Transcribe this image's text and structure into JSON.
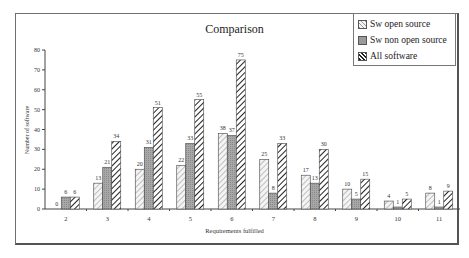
{
  "chart_data": {
    "type": "bar",
    "title": "Comparison",
    "xlabel": "Requirements fulfilled",
    "ylabel": "Number of software",
    "ylim": [
      0,
      80
    ],
    "yticks": [
      0,
      10,
      20,
      30,
      40,
      50,
      60,
      70,
      80
    ],
    "grid": false,
    "legend_position": "top-right",
    "categories": [
      "2",
      "3",
      "4",
      "5",
      "6",
      "7",
      "8",
      "9",
      "10",
      "11"
    ],
    "series": [
      {
        "name": "Sw open source",
        "pattern": "light-diagonal-hatch",
        "values": [
          0,
          13,
          20,
          22,
          38,
          25,
          17,
          10,
          4,
          8
        ]
      },
      {
        "name": "Sw non open source",
        "pattern": "gray-dotted",
        "values": [
          6,
          21,
          31,
          33,
          37,
          8,
          13,
          5,
          1,
          1
        ]
      },
      {
        "name": "All software",
        "pattern": "dark-diagonal-hatch",
        "values": [
          6,
          34,
          51,
          55,
          75,
          33,
          30,
          15,
          5,
          9
        ]
      }
    ]
  },
  "legend": {
    "items": [
      "Sw open source",
      "Sw non open source",
      "All software"
    ]
  }
}
